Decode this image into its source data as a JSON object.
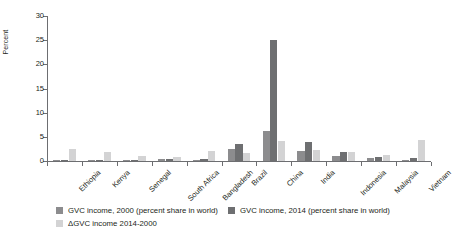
{
  "chart_data": {
    "type": "bar",
    "title": "",
    "xlabel": "",
    "ylabel": "Percent",
    "ylim": [
      0,
      30
    ],
    "yticks": [
      0,
      5,
      10,
      15,
      20,
      25,
      30
    ],
    "grid": false,
    "legend_position": "bottom",
    "categories": [
      "Ethiopia",
      "Kenya",
      "Senegal",
      "South Africa",
      "Bangladesh",
      "Brazil",
      "China",
      "India",
      "Indonesia",
      "Malaysia",
      "Vietnam"
    ],
    "series": [
      {
        "name": "GVC income, 2000 (percent share in world)",
        "color": "#8c8c8e",
        "values": [
          0.05,
          0.03,
          0.03,
          0.45,
          0.25,
          2.4,
          6.3,
          2.0,
          1.1,
          0.6,
          0.1
        ]
      },
      {
        "name": "GVC income, 2014 (percent share in world)",
        "color": "#6e6f71",
        "values": [
          0.1,
          0.05,
          0.05,
          0.5,
          0.35,
          3.5,
          25.1,
          3.9,
          1.8,
          0.8,
          0.7
        ]
      },
      {
        "name": "ΔGVC income 2014-2000",
        "color": "#d3d3d4",
        "values": [
          2.5,
          1.8,
          1.0,
          0.9,
          2.1,
          1.6,
          4.1,
          2.2,
          1.8,
          1.3,
          4.3
        ]
      }
    ]
  },
  "axis": {
    "y_title": "Percent",
    "y_tick_labels": [
      "0",
      "5",
      "10",
      "15",
      "20",
      "25",
      "30"
    ]
  },
  "legend": {
    "items": [
      {
        "label": "GVC income, 2000 (percent share in world)",
        "swatch": "sw0"
      },
      {
        "label": "GVC income, 2014 (percent share in world)",
        "swatch": "sw1"
      },
      {
        "label": "ΔGVC income 2014-2000",
        "swatch": "sw2"
      }
    ]
  }
}
